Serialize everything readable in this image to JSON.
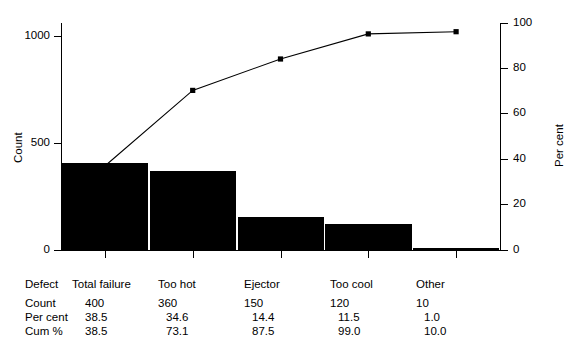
{
  "axes": {
    "left": {
      "title": "Count",
      "ticks": [
        "0",
        "500",
        "1000"
      ],
      "values": [
        0,
        500,
        1000
      ],
      "min": 0,
      "max": 1040
    },
    "right": {
      "title": "Per cent",
      "ticks": [
        "0",
        "20",
        "40",
        "60",
        "80",
        "100"
      ],
      "values": [
        0,
        20,
        40,
        60,
        80,
        100
      ],
      "min": 0,
      "max": 104
    }
  },
  "table": {
    "row_labels": [
      "Defect",
      "Count",
      "Per cent",
      "Cum %"
    ],
    "columns": [
      "Total failure",
      "Too hot",
      "Ejector",
      "Too cool",
      "Other"
    ],
    "count": [
      "400",
      "360",
      "150",
      "120",
      "10"
    ],
    "per_cent": [
      "38.5",
      "34.6",
      "14.4",
      "11.5",
      "1.0"
    ],
    "cum_pct": [
      "38.5",
      "73.1",
      "87.5",
      "99.0",
      "10.0"
    ]
  },
  "style": {
    "bar_color": "#000000",
    "line_color": "#000000",
    "axis_color": "#000000",
    "background": "#ffffff"
  },
  "chart_data": {
    "type": "bar",
    "title": "",
    "subtitle": "",
    "xlabel": "",
    "ylabel": "Count",
    "y2label": "Per cent",
    "categories": [
      "Total failure",
      "Too hot",
      "Ejector",
      "Too cool",
      "Other"
    ],
    "values": [
      400,
      360,
      150,
      120,
      10
    ],
    "ylim": [
      0,
      1040
    ],
    "y2lim": [
      0,
      104
    ],
    "yticks": [
      0,
      500,
      1000
    ],
    "y2ticks": [
      0,
      20,
      40,
      60,
      80,
      100
    ],
    "grid": false,
    "legend": "none",
    "series": [
      {
        "name": "Count",
        "type": "bar",
        "axis": "left",
        "values": [
          400,
          360,
          150,
          120,
          10
        ]
      },
      {
        "name": "Cum %",
        "type": "line",
        "axis": "right",
        "marker": "square",
        "values": [
          38.5,
          73.1,
          87.5,
          99.0,
          100.0
        ]
      }
    ],
    "annotations": {
      "per_cent": [
        38.5,
        34.6,
        14.4,
        11.5,
        1.0
      ],
      "cum_pct_table": [
        38.5,
        73.1,
        87.5,
        99.0,
        10.0
      ]
    }
  }
}
